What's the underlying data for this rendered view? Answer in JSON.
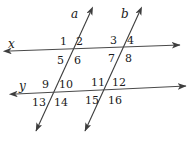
{
  "figure": {
    "type": "geometry-diagram",
    "width": 194,
    "height": 143,
    "background_color": "#ffffff",
    "stroke_color": "#3d3d3d",
    "text_color": "#1a1a1a"
  },
  "lines": [
    {
      "id": "a",
      "label": "a",
      "kind": "transversal",
      "label_x": 71,
      "label_y": 8,
      "x1": 90,
      "y1": 13,
      "x2": 36,
      "y2": 131
    },
    {
      "id": "b",
      "label": "b",
      "kind": "transversal",
      "label_x": 121,
      "label_y": 8,
      "x1": 139,
      "y1": 13,
      "x2": 85,
      "y2": 131
    },
    {
      "id": "x",
      "label": "x",
      "kind": "horizontal",
      "label_x": 8,
      "label_y": 38,
      "x1": 10,
      "y1": 51,
      "x2": 180,
      "y2": 45
    },
    {
      "id": "y",
      "label": "y",
      "kind": "horizontal",
      "label_x": 19,
      "label_y": 80,
      "x1": 16,
      "y1": 94,
      "x2": 186,
      "y2": 86
    }
  ],
  "angles": [
    {
      "n": "1",
      "x": 60,
      "y": 36
    },
    {
      "n": "2",
      "x": 76,
      "y": 36
    },
    {
      "n": "3",
      "x": 110,
      "y": 35
    },
    {
      "n": "4",
      "x": 127,
      "y": 35
    },
    {
      "n": "5",
      "x": 57,
      "y": 55
    },
    {
      "n": "6",
      "x": 74,
      "y": 55
    },
    {
      "n": "7",
      "x": 108,
      "y": 53
    },
    {
      "n": "8",
      "x": 125,
      "y": 53
    },
    {
      "n": "9",
      "x": 42,
      "y": 79
    },
    {
      "n": "10",
      "x": 59,
      "y": 79
    },
    {
      "n": "11",
      "x": 91,
      "y": 77
    },
    {
      "n": "12",
      "x": 112,
      "y": 77
    },
    {
      "n": "13",
      "x": 32,
      "y": 97
    },
    {
      "n": "14",
      "x": 54,
      "y": 97
    },
    {
      "n": "15",
      "x": 85,
      "y": 95
    },
    {
      "n": "16",
      "x": 108,
      "y": 95
    }
  ]
}
